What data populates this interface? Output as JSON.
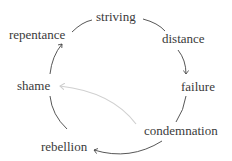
{
  "diagram": {
    "type": "cycle",
    "nodes": [
      {
        "id": "striving",
        "label": "striving"
      },
      {
        "id": "distance",
        "label": "distance"
      },
      {
        "id": "failure",
        "label": "failure"
      },
      {
        "id": "condemnation",
        "label": "condemnation"
      },
      {
        "id": "rebellion",
        "label": "rebellion"
      },
      {
        "id": "shame",
        "label": "shame"
      },
      {
        "id": "repentance",
        "label": "repentance"
      }
    ],
    "edges": [
      {
        "from": "striving",
        "to": "distance"
      },
      {
        "from": "distance",
        "to": "failure",
        "arrow": true
      },
      {
        "from": "failure",
        "to": "condemnation"
      },
      {
        "from": "condemnation",
        "to": "rebellion",
        "arrow": true
      },
      {
        "from": "rebellion",
        "to": "shame"
      },
      {
        "from": "shame",
        "to": "repentance",
        "arrow": true
      },
      {
        "from": "repentance",
        "to": "striving"
      },
      {
        "from": "condemnation",
        "to": "shame",
        "arrow": true,
        "style": "faint"
      }
    ],
    "colors": {
      "text": "#3a3a3a",
      "line": "#444444",
      "faint": "#d0d0d0"
    }
  }
}
